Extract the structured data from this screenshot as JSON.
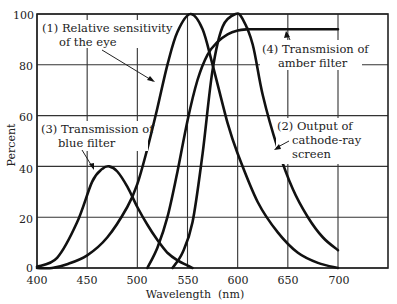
{
  "chart_data": {
    "type": "line",
    "title": "",
    "xlabel": "Wavelength (nm)",
    "ylabel": "Percent",
    "xlim": [
      400,
      750
    ],
    "ylim": [
      0,
      100
    ],
    "grid": true,
    "legend": "none (curves labeled by inline annotations)",
    "x_ticks": [
      400,
      450,
      500,
      550,
      600,
      650,
      700
    ],
    "y_ticks": [
      0,
      20,
      40,
      60,
      80,
      100
    ],
    "series": [
      {
        "name": "(1) Relative sensitivity of the eye",
        "x": [
          400,
          415,
          430,
          450,
          470,
          490,
          500,
          510,
          520,
          530,
          540,
          553,
          565,
          575,
          590,
          600,
          620,
          640,
          660,
          680,
          700
        ],
        "values": [
          0,
          0,
          1.5,
          5,
          12,
          24,
          33,
          47,
          63,
          80,
          93,
          100,
          94,
          80,
          57,
          45,
          26,
          14,
          6,
          2,
          0
        ]
      },
      {
        "name": "(2) Output of cathode-ray screen",
        "x": [
          535,
          545,
          555,
          565,
          575,
          585,
          598,
          605,
          615,
          625,
          640,
          655,
          670,
          685,
          700
        ],
        "values": [
          0,
          6,
          18,
          45,
          78,
          95,
          100,
          98,
          88,
          68,
          47,
          31,
          20,
          12,
          7
        ]
      },
      {
        "name": "(3) Transmission of blue filter",
        "x": [
          400,
          420,
          440,
          455,
          465,
          472,
          480,
          490,
          500,
          510,
          520,
          530,
          540,
          550,
          555
        ],
        "values": [
          0.5,
          4,
          18,
          34,
          39,
          40,
          38,
          32,
          24,
          17,
          11,
          6,
          3,
          1,
          0
        ]
      },
      {
        "name": "(4) Transmision of amber filter",
        "x": [
          510,
          520,
          530,
          540,
          550,
          560,
          570,
          580,
          590,
          600,
          610,
          620,
          700
        ],
        "values": [
          0,
          8,
          20,
          38,
          58,
          74,
          84,
          89,
          92,
          93.5,
          94,
          94,
          94
        ]
      }
    ],
    "annotations": [
      {
        "text": "(1) Relative sensitivity of the eye",
        "points_to": "curve 1 near 520 nm"
      },
      {
        "text": "(2) Output of cathode-ray screen",
        "points_to": "curve 2 near 635 nm"
      },
      {
        "text": "(3) Transmission of blue filter",
        "points_to": "curve 3 near 462 nm"
      },
      {
        "text": "(4) Transmision of amber filter",
        "points_to": "curve 4 plateau near 630 nm"
      }
    ]
  },
  "labels": {
    "ylabel": "Percent",
    "xlabel": "Wavelength  (nm)",
    "y_ticks": [
      "0",
      "20",
      "40",
      "60",
      "80",
      "100"
    ],
    "x_ticks": [
      "400",
      "450",
      "500",
      "550",
      "600",
      "650",
      "700"
    ],
    "annot1_line1": "(1) Relative sensitivity",
    "annot1_line2": "of the eye",
    "annot2_line1": "(2) Output of",
    "annot2_line2": "cathode-ray",
    "annot2_line3": "screen",
    "annot3_line1": "(3) Transmission of",
    "annot3_line2": "blue filter",
    "annot4_line1": "(4) Transmision of",
    "annot4_line2": "amber filter"
  }
}
